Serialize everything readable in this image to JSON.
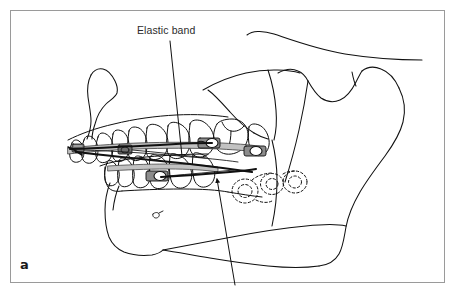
{
  "figure": {
    "panel_letter": "a",
    "background_color": "#ffffff",
    "frame_color": "#9a9a9a",
    "line_color": "#1a1a1a",
    "wire_fill_color": "#bdbdbd",
    "bracket_fill_color": "#8c8c8c"
  },
  "callouts": [
    {
      "id": "elastic-band",
      "label": "Elastic band",
      "label_x": 137,
      "label_y": 25,
      "leader_from": [
        170,
        40
      ],
      "leader_to": [
        182,
        156
      ]
    },
    {
      "id": "lower-leader",
      "label": "",
      "leader_from": [
        235,
        283
      ],
      "leader_to": [
        216,
        177
      ],
      "arrowhead": true
    }
  ],
  "anatomy": {
    "structures": [
      "cranial-base",
      "maxilla",
      "anterior-nasal-spine",
      "maxillary-teeth",
      "mandibular-teeth",
      "mandible-body",
      "mandibular-ramus",
      "condyle",
      "coronoid-process",
      "sigmoid-notch",
      "gonial-angle",
      "mental-foramen",
      "unerupted-tooth-roots"
    ]
  },
  "appliance": {
    "upper_archwire": "maxillary archwire with brackets",
    "lower_archwire": "mandibular archwire with brackets",
    "elastic_band": "intermaxillary elastic from upper molar hook to lower anterior bracket",
    "bracket_count_upper": 3,
    "bracket_count_lower": 2
  }
}
